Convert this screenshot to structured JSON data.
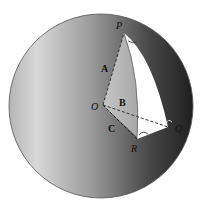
{
  "diagram": {
    "type": "spherical-triangle",
    "points": {
      "O": "O",
      "P": "P",
      "Q": "Q",
      "R": "R"
    },
    "arcs": {
      "A": "A",
      "B": "B",
      "C": "C"
    },
    "colors": {
      "sphere_light": "#c8c8c8",
      "sphere_dark": "#2a2a2a",
      "triangle": "#ffffff",
      "outline": "#333333"
    }
  }
}
